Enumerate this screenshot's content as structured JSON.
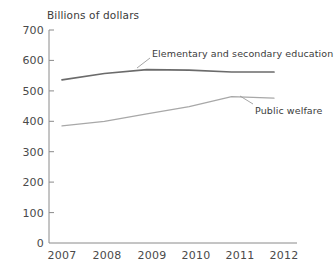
{
  "chart_data": {
    "type": "line",
    "title": "Billions of dollars",
    "xlabel": "",
    "ylabel": "",
    "x": [
      "2007",
      "2008",
      "2009",
      "2010",
      "2011",
      "2012"
    ],
    "categories": [
      "2007",
      "2008",
      "2009",
      "2010",
      "2011",
      "2012"
    ],
    "series": [
      {
        "name": "Elementary and secondary education",
        "values": [
          536,
          557,
          570,
          568,
          562,
          562
        ],
        "color": "#6b6b6b"
      },
      {
        "name": "Public welfare",
        "values": [
          385,
          400,
          424,
          448,
          481,
          476
        ],
        "color": "#a8a8a8"
      }
    ],
    "ylim": [
      0,
      700
    ],
    "yticks": [
      "0",
      "100",
      "200",
      "300",
      "400",
      "500",
      "600",
      "700"
    ],
    "xticks": [
      "2007",
      "2008",
      "2009",
      "2010",
      "2011",
      "2012"
    ],
    "grid": false,
    "legend": "inline-annotations",
    "annotations": [
      {
        "text": "Elementary and secondary education",
        "series": "Elementary and secondary education"
      },
      {
        "text": "Public welfare",
        "series": "Public welfare"
      }
    ]
  },
  "axis": {
    "title": "Billions of dollars",
    "y_ticks": [
      {
        "label": "700",
        "value": 700
      },
      {
        "label": "600",
        "value": 600
      },
      {
        "label": "500",
        "value": 500
      },
      {
        "label": "400",
        "value": 400
      },
      {
        "label": "300",
        "value": 300
      },
      {
        "label": "200",
        "value": 200
      },
      {
        "label": "100",
        "value": 100
      },
      {
        "label": "0",
        "value": 0
      }
    ],
    "x_ticks": [
      {
        "label": "2007"
      },
      {
        "label": "2008"
      },
      {
        "label": "2009"
      },
      {
        "label": "2010"
      },
      {
        "label": "2011"
      },
      {
        "label": "2012"
      }
    ]
  },
  "labels": {
    "education": "Elementary and secondary education",
    "welfare": "Public welfare"
  },
  "colors": {
    "education_line": "#6b6b6b",
    "welfare_line": "#a8a8a8",
    "axis": "#8a8a8a",
    "text": "#4a4a4a",
    "background": "#ffffff"
  }
}
